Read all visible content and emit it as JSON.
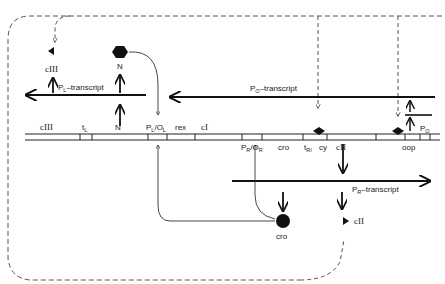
{
  "diagram": {
    "genes_on_map": [
      "cIII",
      "tL",
      "N",
      "PL/OL",
      "rex",
      "cI",
      "PR/OR",
      "cro",
      "tRI",
      "cy",
      "cII",
      "oop",
      "PO"
    ],
    "labels": {
      "ciii_top": "cIII",
      "n_top": "N",
      "pl_transcript_main": "P",
      "pl_transcript_sub": "L",
      "pl_transcript_rest": "–transcript",
      "po_transcript_main": "P",
      "po_transcript_sub": "O",
      "po_transcript_rest": "–transcript",
      "pr_transcript_main": "P",
      "pr_transcript_sub": "R",
      "pr_transcript_rest": "–transcript",
      "map_ciii": "cIII",
      "map_tl_main": "t",
      "map_tl_sub": "L",
      "map_n": "N",
      "map_plol_p": "P",
      "map_plol_psub": "L",
      "map_plol_o": "/O",
      "map_plol_osub": "L",
      "map_rex": "rex",
      "map_ci": "cI",
      "map_pror_p": "P",
      "map_pror_psub": "R",
      "map_pror_o": "/O",
      "map_pror_osub": "R",
      "map_cro": "cro",
      "map_tri_main": "t",
      "map_tri_sub": "RI",
      "map_cy": "cy",
      "map_cii": "cII",
      "map_oop": "oop",
      "map_po_main": "P",
      "map_po_sub": "O",
      "cro_protein": "cro",
      "cii_protein": "cII"
    },
    "symbols": {
      "N_protein": "hexagon",
      "cro_protein": "circle",
      "cIII_protein": "left-triangle",
      "cII_protein": "right-triangle",
      "binding_site": "diamond"
    }
  }
}
